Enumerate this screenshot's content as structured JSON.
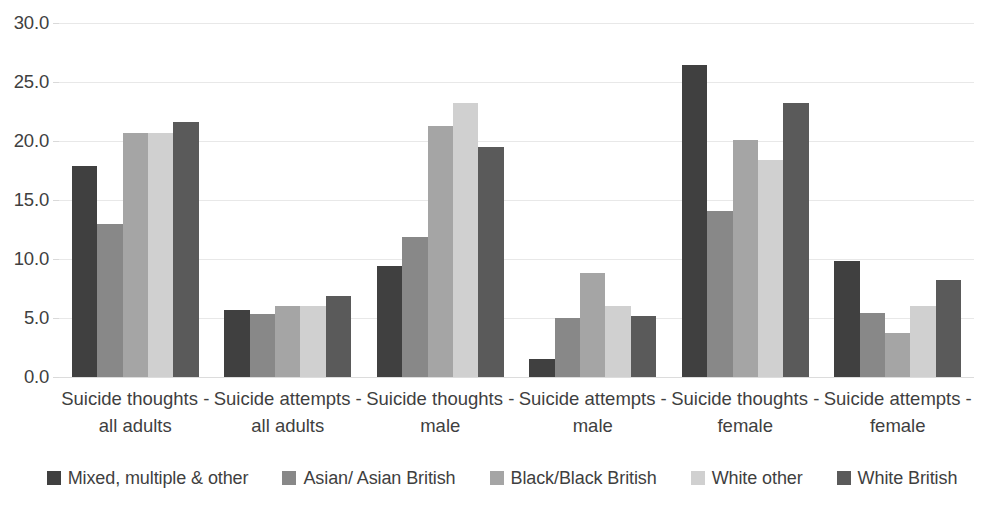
{
  "chart_data": {
    "type": "bar",
    "title": "",
    "subtitle": "",
    "xlabel": "",
    "ylabel": "",
    "ylim": [
      0.0,
      30.0
    ],
    "y_tick_step": 5.0,
    "y_tick_labels": [
      "30.0",
      "25.0",
      "20.0",
      "15.0",
      "10.0",
      "5.0",
      "0.0"
    ],
    "y_tick_values": [
      30.0,
      25.0,
      20.0,
      15.0,
      10.0,
      5.0,
      0.0
    ],
    "grid": true,
    "grid_axis": "y",
    "legend_position": "bottom",
    "categories": [
      "Suicide thoughts - all adults",
      "Suicide attempts - all adults",
      "Suicide thoughts - male",
      "Suicide attempts - male",
      "Suicide thoughts - female",
      "Suicide attempts - female"
    ],
    "category_lines": [
      [
        "Suicide thoughts -",
        "all adults"
      ],
      [
        "Suicide attempts -",
        "all adults"
      ],
      [
        "Suicide thoughts -",
        "male"
      ],
      [
        "Suicide attempts -",
        "male"
      ],
      [
        "Suicide thoughts -",
        "female"
      ],
      [
        "Suicide attempts -",
        "female"
      ]
    ],
    "series": [
      {
        "name": "Mixed, multiple & other",
        "color": "#404040",
        "values": [
          17.9,
          5.7,
          9.4,
          1.5,
          26.4,
          9.8
        ]
      },
      {
        "name": "Asian/ Asian British",
        "color": "#888888",
        "values": [
          13.0,
          5.3,
          11.9,
          5.0,
          14.1,
          5.4
        ]
      },
      {
        "name": "Black/Black British",
        "color": "#A5A5A5",
        "values": [
          20.7,
          6.0,
          21.3,
          8.8,
          20.1,
          3.7
        ]
      },
      {
        "name": "White other",
        "color": "#D0D0D0",
        "values": [
          20.7,
          6.0,
          23.2,
          6.0,
          18.4,
          6.0
        ]
      },
      {
        "name": "White British",
        "color": "#5A5A5A",
        "values": [
          21.6,
          6.9,
          19.5,
          5.2,
          23.2,
          8.2
        ]
      }
    ]
  },
  "legend": {
    "items": [
      {
        "label": "Mixed, multiple & other",
        "color": "#404040"
      },
      {
        "label": "Asian/ Asian British",
        "color": "#888888"
      },
      {
        "label": "Black/Black British",
        "color": "#A5A5A5"
      },
      {
        "label": "White other",
        "color": "#D0D0D0"
      },
      {
        "label": "White British",
        "color": "#5A5A5A"
      }
    ]
  },
  "axis": {
    "y_labels": [
      "30.0",
      "25.0",
      "20.0",
      "15.0",
      "10.0",
      "5.0",
      "0.0"
    ]
  }
}
